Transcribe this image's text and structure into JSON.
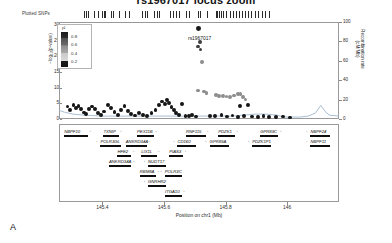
{
  "title": "rs1967017 locus zoom",
  "panel_label": "A",
  "snp_track": {
    "label": "Plotted SNPs",
    "tick_positions": [
      0.028,
      0.035,
      0.042,
      0.07,
      0.085,
      0.105,
      0.112,
      0.119,
      0.145,
      0.152,
      0.18,
      0.205,
      0.222,
      0.28,
      0.29,
      0.3,
      0.33,
      0.345,
      0.352,
      0.4,
      0.412,
      0.425,
      0.438,
      0.47,
      0.482,
      0.52,
      0.532,
      0.56,
      0.6,
      0.606,
      0.612,
      0.62,
      0.63,
      0.645,
      0.66,
      0.672,
      0.685,
      0.7,
      0.712,
      0.726,
      0.74,
      0.752,
      0.768,
      0.782,
      0.798,
      0.812,
      0.83
    ]
  },
  "legend": {
    "title": "r²",
    "ticks": [
      "0.8",
      "0.6",
      "0.4",
      "0.2"
    ]
  },
  "yaxis": {
    "label": "−log₁₀(p-value)",
    "ticks": [
      "0",
      "5",
      "10",
      "15",
      "20",
      "25",
      "30"
    ],
    "min": 0,
    "max": 31
  },
  "raxis": {
    "label": "Recombination rate (cM/Mb)",
    "ticks": [
      "0",
      "20",
      "40",
      "60",
      "80",
      "100"
    ],
    "min": 0,
    "max": 100
  },
  "xaxis": {
    "label": "Position on chr1 (Mb)",
    "ticks": [
      "145.4",
      "145.6",
      "145.8",
      "146"
    ],
    "tick_fracs": [
      0.155,
      0.375,
      0.595,
      0.815
    ],
    "min": 145.3,
    "max": 146.1
  },
  "lead_snp": {
    "id": "rs1967017",
    "x_frac": 0.497,
    "neg_log_p": 29.0
  },
  "chart_data": {
    "type": "scatter",
    "title": "rs1967017 locus zoom",
    "xlabel": "Position on chr1 (Mb)",
    "ylabel": "−log₁₀(p-value)",
    "y2label": "Recombination rate (cM/Mb)",
    "xlim": [
      145.3,
      146.1
    ],
    "ylim": [
      0,
      31
    ],
    "y2lim": [
      0,
      100
    ],
    "grid": false,
    "legend_position": "top-left",
    "points": [
      {
        "x": 0.497,
        "y": 29.0,
        "r2": 0.95,
        "lead": true
      },
      {
        "x": 0.503,
        "y": 24.6,
        "r2": 0.55
      },
      {
        "x": 0.497,
        "y": 23.2,
        "r2": 0.5
      },
      {
        "x": 0.505,
        "y": 22.2,
        "r2": 0.48
      },
      {
        "x": 0.51,
        "y": 18.3,
        "r2": 0.42
      },
      {
        "x": 0.497,
        "y": 9.1,
        "r2": 0.4
      },
      {
        "x": 0.518,
        "y": 8.8,
        "r2": 0.38
      },
      {
        "x": 0.527,
        "y": 8.4,
        "r2": 0.36
      },
      {
        "x": 0.56,
        "y": 7.6,
        "r2": 0.34
      },
      {
        "x": 0.572,
        "y": 7.4,
        "r2": 0.33
      },
      {
        "x": 0.585,
        "y": 7.3,
        "r2": 0.32
      },
      {
        "x": 0.598,
        "y": 7.2,
        "r2": 0.31
      },
      {
        "x": 0.612,
        "y": 7.1,
        "r2": 0.3
      },
      {
        "x": 0.626,
        "y": 7.5,
        "r2": 0.35
      },
      {
        "x": 0.638,
        "y": 7.9,
        "r2": 0.37
      },
      {
        "x": 0.648,
        "y": 8.1,
        "r2": 0.39
      },
      {
        "x": 0.658,
        "y": 7.0,
        "r2": 0.29
      },
      {
        "x": 0.666,
        "y": 6.2,
        "r2": 0.26
      },
      {
        "x": 0.676,
        "y": 4.4,
        "r2": 0.22
      },
      {
        "x": 0.646,
        "y": 4.1,
        "r2": 0.2
      },
      {
        "x": 0.03,
        "y": 4.0,
        "r2": 0.05
      },
      {
        "x": 0.04,
        "y": 3.0,
        "r2": 0.05
      },
      {
        "x": 0.052,
        "y": 4.6,
        "r2": 0.05
      },
      {
        "x": 0.061,
        "y": 3.4,
        "r2": 0.05
      },
      {
        "x": 0.07,
        "y": 4.1,
        "r2": 0.05
      },
      {
        "x": 0.079,
        "y": 3.1,
        "r2": 0.05
      },
      {
        "x": 0.088,
        "y": 2.1,
        "r2": 0.05
      },
      {
        "x": 0.097,
        "y": 1.6,
        "r2": 0.05
      },
      {
        "x": 0.106,
        "y": 3.2,
        "r2": 0.05
      },
      {
        "x": 0.118,
        "y": 4.0,
        "r2": 0.05
      },
      {
        "x": 0.128,
        "y": 3.3,
        "r2": 0.05
      },
      {
        "x": 0.138,
        "y": 1.8,
        "r2": 0.05
      },
      {
        "x": 0.15,
        "y": 1.2,
        "r2": 0.05
      },
      {
        "x": 0.162,
        "y": 2.4,
        "r2": 0.05
      },
      {
        "x": 0.175,
        "y": 4.5,
        "r2": 0.05
      },
      {
        "x": 0.186,
        "y": 3.6,
        "r2": 0.05
      },
      {
        "x": 0.198,
        "y": 2.3,
        "r2": 0.05
      },
      {
        "x": 0.21,
        "y": 1.4,
        "r2": 0.05
      },
      {
        "x": 0.222,
        "y": 3.0,
        "r2": 0.05
      },
      {
        "x": 0.234,
        "y": 4.2,
        "r2": 0.05
      },
      {
        "x": 0.246,
        "y": 2.6,
        "r2": 0.05
      },
      {
        "x": 0.258,
        "y": 1.5,
        "r2": 0.05
      },
      {
        "x": 0.272,
        "y": 1.1,
        "r2": 0.05
      },
      {
        "x": 0.286,
        "y": 2.0,
        "r2": 0.05
      },
      {
        "x": 0.3,
        "y": 1.3,
        "r2": 0.05
      },
      {
        "x": 0.315,
        "y": 1.0,
        "r2": 0.05
      },
      {
        "x": 0.33,
        "y": 1.8,
        "r2": 0.05
      },
      {
        "x": 0.345,
        "y": 2.9,
        "r2": 0.05
      },
      {
        "x": 0.358,
        "y": 4.4,
        "r2": 0.05
      },
      {
        "x": 0.368,
        "y": 5.6,
        "r2": 0.05
      },
      {
        "x": 0.378,
        "y": 4.9,
        "r2": 0.05
      },
      {
        "x": 0.386,
        "y": 6.0,
        "r2": 0.06
      },
      {
        "x": 0.394,
        "y": 5.2,
        "r2": 0.06
      },
      {
        "x": 0.402,
        "y": 3.9,
        "r2": 0.05
      },
      {
        "x": 0.41,
        "y": 2.8,
        "r2": 0.05
      },
      {
        "x": 0.418,
        "y": 1.9,
        "r2": 0.05
      },
      {
        "x": 0.428,
        "y": 1.2,
        "r2": 0.05
      },
      {
        "x": 0.44,
        "y": 4.8,
        "r2": 0.06
      },
      {
        "x": 0.452,
        "y": 1.0,
        "r2": 0.05
      },
      {
        "x": 0.464,
        "y": 0.9,
        "r2": 0.05
      },
      {
        "x": 0.476,
        "y": 1.4,
        "r2": 0.05
      },
      {
        "x": 0.49,
        "y": 0.8,
        "r2": 0.05
      },
      {
        "x": 0.54,
        "y": 1.0,
        "r2": 0.05
      },
      {
        "x": 0.556,
        "y": 0.9,
        "r2": 0.05
      },
      {
        "x": 0.58,
        "y": 1.2,
        "r2": 0.05
      },
      {
        "x": 0.6,
        "y": 0.8,
        "r2": 0.05
      },
      {
        "x": 0.62,
        "y": 1.1,
        "r2": 0.05
      },
      {
        "x": 0.64,
        "y": 0.7,
        "r2": 0.05
      },
      {
        "x": 0.66,
        "y": 1.0,
        "r2": 0.05
      },
      {
        "x": 0.69,
        "y": 0.8,
        "r2": 0.05
      },
      {
        "x": 0.71,
        "y": 0.6,
        "r2": 0.05
      },
      {
        "x": 0.73,
        "y": 0.9,
        "r2": 0.05
      },
      {
        "x": 0.75,
        "y": 0.7,
        "r2": 0.05
      },
      {
        "x": 0.775,
        "y": 0.6,
        "r2": 0.05
      },
      {
        "x": 0.8,
        "y": 0.8,
        "r2": 0.05
      },
      {
        "x": 0.825,
        "y": 0.5,
        "r2": 0.05
      }
    ],
    "recombination_line": [
      {
        "x": 0.0,
        "y": 9
      },
      {
        "x": 0.02,
        "y": 7
      },
      {
        "x": 0.05,
        "y": 5
      },
      {
        "x": 0.09,
        "y": 4
      },
      {
        "x": 0.15,
        "y": 3
      },
      {
        "x": 0.22,
        "y": 3
      },
      {
        "x": 0.3,
        "y": 3
      },
      {
        "x": 0.38,
        "y": 3
      },
      {
        "x": 0.46,
        "y": 3
      },
      {
        "x": 0.54,
        "y": 3
      },
      {
        "x": 0.62,
        "y": 3
      },
      {
        "x": 0.66,
        "y": 4
      },
      {
        "x": 0.7,
        "y": 5
      },
      {
        "x": 0.74,
        "y": 5
      },
      {
        "x": 0.78,
        "y": 4
      },
      {
        "x": 0.8,
        "y": 2
      },
      {
        "x": 0.83,
        "y": 2
      },
      {
        "x": 0.86,
        "y": 2
      },
      {
        "x": 0.89,
        "y": 3
      },
      {
        "x": 0.915,
        "y": 6
      },
      {
        "x": 0.935,
        "y": 14
      },
      {
        "x": 0.95,
        "y": 8
      },
      {
        "x": 0.965,
        "y": 4
      },
      {
        "x": 1.0,
        "y": 3
      }
    ]
  },
  "genes": [
    {
      "name": "NBPF10",
      "row": 0,
      "x": 0.015,
      "w": 0.085,
      "dir": "right",
      "exon": [
        0.0,
        0.062
      ]
    },
    {
      "name": "TXNIP",
      "row": 0,
      "x": 0.155,
      "w": 0.055,
      "dir": "right",
      "exon": [
        0.018,
        0.012
      ]
    },
    {
      "name": "POLR3GL",
      "row": 1,
      "x": 0.13,
      "w": 0.075,
      "dir": "left",
      "exon": [
        0.03,
        0.014
      ]
    },
    {
      "name": "HFE2",
      "row": 2,
      "x": 0.205,
      "w": 0.05,
      "dir": "right",
      "exon": [
        0.018,
        0.012
      ]
    },
    {
      "name": "ANKRD34A",
      "row": 1,
      "x": 0.235,
      "w": 0.075,
      "dir": "right",
      "exon": [
        0.03,
        0.014
      ]
    },
    {
      "name": "ANKRD34A",
      "row": 3,
      "x": 0.175,
      "w": 0.08,
      "dir": "right",
      "exon": [
        0.032,
        0.014
      ]
    },
    {
      "name": "LIX1L",
      "row": 2,
      "x": 0.29,
      "w": 0.055,
      "dir": "right",
      "exon": [
        0.018,
        0.016
      ]
    },
    {
      "name": "NUDT17",
      "row": 3,
      "x": 0.3,
      "w": 0.065,
      "dir": "left",
      "exon": [
        0.03,
        0.012
      ]
    },
    {
      "name": "PEX11B",
      "row": 0,
      "x": 0.275,
      "w": 0.06,
      "dir": "right",
      "exon": [
        0.02,
        0.012
      ]
    },
    {
      "name": "RBM8A",
      "row": 4,
      "x": 0.285,
      "w": 0.058,
      "dir": "right",
      "exon": [
        0.022,
        0.012
      ]
    },
    {
      "name": "POLR3C",
      "row": 4,
      "x": 0.36,
      "w": 0.062,
      "dir": "left",
      "exon": [
        0.026,
        0.014
      ]
    },
    {
      "name": "PIAS3",
      "row": 2,
      "x": 0.39,
      "w": 0.05,
      "dir": "right",
      "exon": [
        0.018,
        0.012
      ]
    },
    {
      "name": "GNRHR2",
      "row": 5,
      "x": 0.3,
      "w": 0.065,
      "dir": "left",
      "exon": [
        0.028,
        0.012
      ]
    },
    {
      "name": "ITGA10",
      "row": 6,
      "x": 0.375,
      "w": 0.06,
      "dir": "right",
      "exon": [
        0.02,
        0.022
      ]
    },
    {
      "name": "RNF115",
      "row": 0,
      "x": 0.45,
      "w": 0.07,
      "dir": "right",
      "exon": [
        0.0,
        0.03
      ]
    },
    {
      "name": "CD160",
      "row": 1,
      "x": 0.405,
      "w": 0.065,
      "dir": "left",
      "exon": [
        0.03,
        0.014
      ]
    },
    {
      "name": "PDZK1",
      "row": 0,
      "x": 0.565,
      "w": 0.06,
      "dir": "right",
      "exon": [
        0.018,
        0.026
      ]
    },
    {
      "name": "GPR89A",
      "row": 1,
      "x": 0.52,
      "w": 0.07,
      "dir": "left",
      "exon": [
        0.03,
        0.016
      ]
    },
    {
      "name": "GPR89C",
      "row": 0,
      "x": 0.715,
      "w": 0.065,
      "dir": "right",
      "exon": [
        0.022,
        0.018
      ]
    },
    {
      "name": "PDZK1P1",
      "row": 1,
      "x": 0.672,
      "w": 0.068,
      "dir": "left",
      "exon": [
        0.028,
        0.016
      ]
    },
    {
      "name": "NBPF24",
      "row": 0,
      "x": 0.88,
      "w": 0.07,
      "dir": "left",
      "exon": [
        0.022,
        0.03
      ]
    },
    {
      "name": "NBPF11",
      "row": 1,
      "x": 0.88,
      "w": 0.07,
      "dir": "left",
      "exon": [
        0.022,
        0.03
      ]
    }
  ]
}
